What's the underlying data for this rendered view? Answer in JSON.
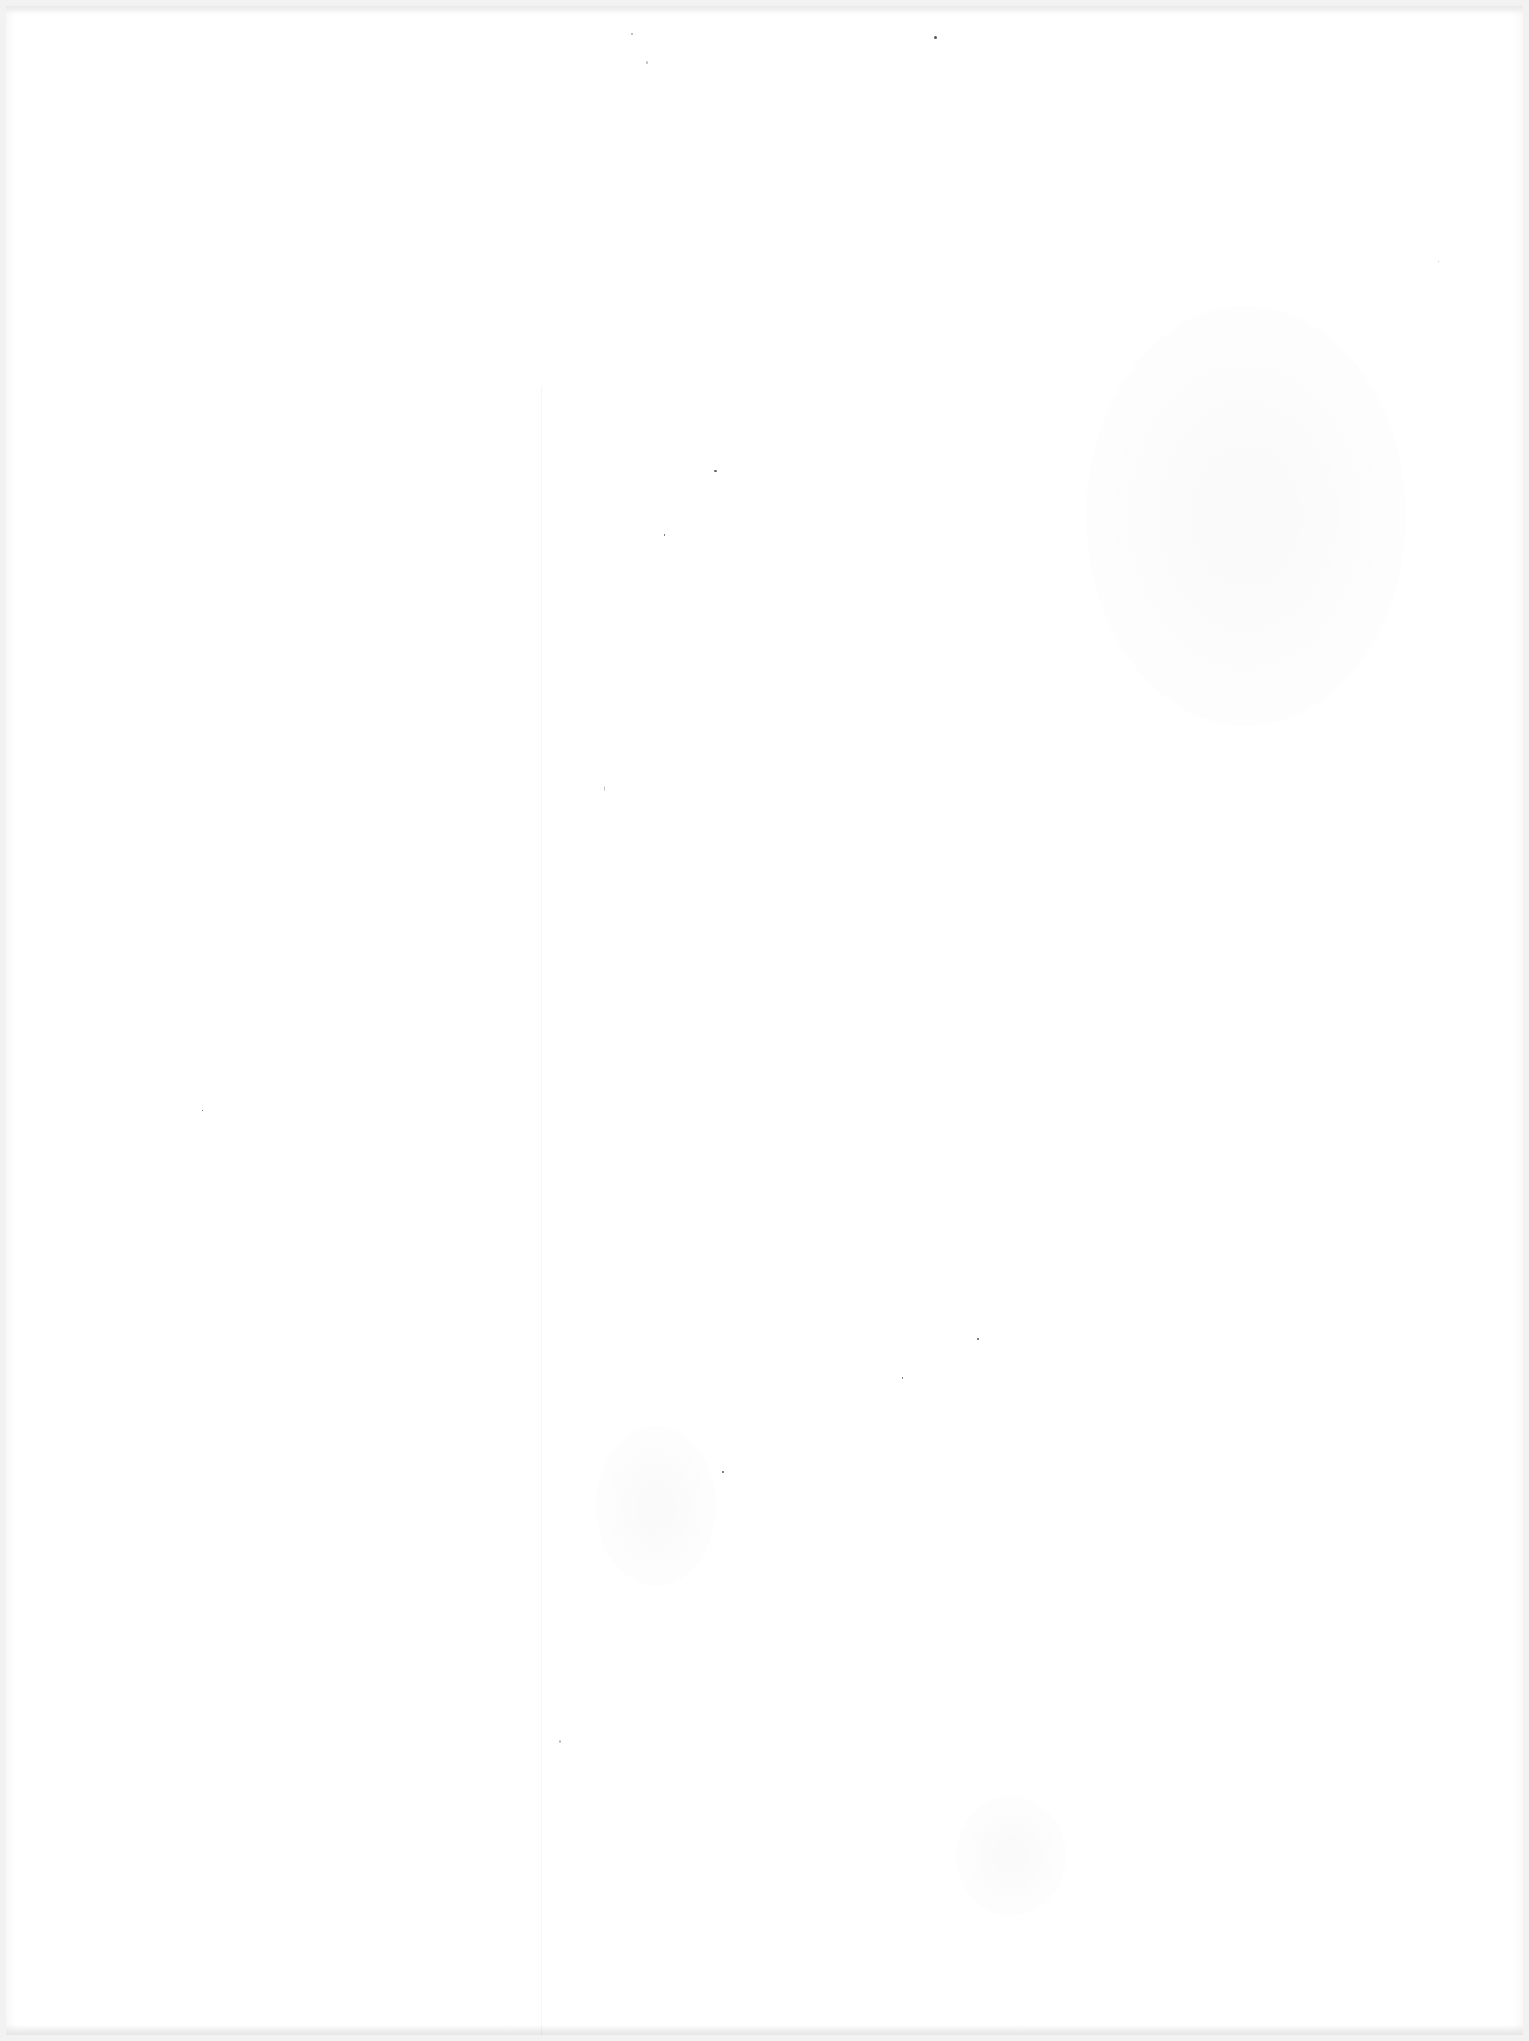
{
  "document": {
    "type": "blank scanned page",
    "visible_text": [],
    "colors": {
      "paper": "#ffffff",
      "border": "#f2f2f2",
      "noise": "#555555"
    }
  }
}
